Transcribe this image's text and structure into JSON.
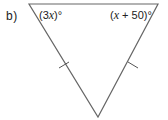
{
  "figure": {
    "part_label": "b)",
    "shape": "triangle",
    "vertices": {
      "top_left": [
        29,
        4
      ],
      "top_right": [
        158,
        4
      ],
      "bottom": [
        98,
        117
      ]
    },
    "line_color": "#666666",
    "angles": {
      "top_left": {
        "prefix": "(3",
        "var": "x",
        "suffix": ")°"
      },
      "top_right": {
        "prefix": "(",
        "var": "x",
        "suffix": " + 50)°"
      }
    },
    "equal_side_marks": [
      "left",
      "right"
    ]
  }
}
